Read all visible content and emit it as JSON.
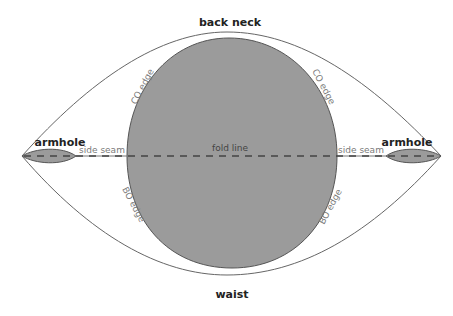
{
  "diagram": {
    "type": "knitting garment schematic",
    "labels": {
      "top": "back neck",
      "bottom": "waist",
      "armhole_left": "armhole",
      "armhole_right": "armhole",
      "side_seam_left": "side seam",
      "side_seam_right": "side seam",
      "fold_line": "fold line",
      "co_edge_left": "CO edge",
      "co_edge_right": "CO edge",
      "bo_edge_left": "BO edge",
      "bo_edge_right": "BO edge"
    },
    "colors": {
      "background": "#ffffff",
      "fill_gray": "#9b9b9b",
      "outline": "#555555",
      "dash": "#444444",
      "text_dark": "#222222",
      "text_light": "#7a7a7a"
    }
  }
}
